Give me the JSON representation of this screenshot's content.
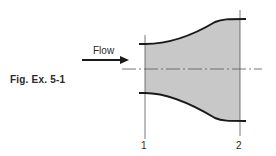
{
  "figure": {
    "caption": "Fig. Ex. 5-1",
    "flow_label": "Flow",
    "section_labels": [
      "1",
      "2"
    ],
    "colors": {
      "fill": "#c8c8c8",
      "wall": "#1a1a1a",
      "line": "#555555",
      "text": "#2a2a2a"
    }
  }
}
